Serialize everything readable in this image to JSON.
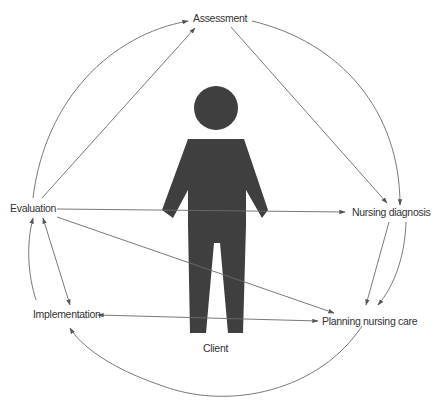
{
  "diagram": {
    "center": {
      "label": "Client",
      "icon": "person-icon"
    },
    "nodes": [
      {
        "id": "assessment",
        "label": "Assessment"
      },
      {
        "id": "nursing_diagnosis",
        "label": "Nursing diagnosis"
      },
      {
        "id": "planning",
        "label": "Planning nursing care"
      },
      {
        "id": "implementation",
        "label": "Implementation"
      },
      {
        "id": "evaluation",
        "label": "Evaluation"
      }
    ],
    "edges": [
      {
        "from": "assessment",
        "to": "nursing_diagnosis",
        "style": "arc"
      },
      {
        "from": "assessment",
        "to": "nursing_diagnosis",
        "style": "straight"
      },
      {
        "from": "nursing_diagnosis",
        "to": "planning",
        "style": "arc"
      },
      {
        "from": "nursing_diagnosis",
        "to": "planning",
        "style": "straight"
      },
      {
        "from": "planning",
        "to": "implementation",
        "style": "arc"
      },
      {
        "from": "implementation",
        "to": "planning",
        "style": "straight-bidirectional"
      },
      {
        "from": "implementation",
        "to": "evaluation",
        "style": "arc"
      },
      {
        "from": "evaluation",
        "to": "implementation",
        "style": "straight-bidirectional"
      },
      {
        "from": "evaluation",
        "to": "assessment",
        "style": "arc"
      },
      {
        "from": "evaluation",
        "to": "assessment",
        "style": "straight"
      },
      {
        "from": "evaluation",
        "to": "nursing_diagnosis",
        "style": "straight"
      },
      {
        "from": "evaluation",
        "to": "planning",
        "style": "straight"
      }
    ],
    "colors": {
      "line": "#6a6a6a",
      "figure": "#3f3f3f",
      "text": "#333333"
    }
  }
}
